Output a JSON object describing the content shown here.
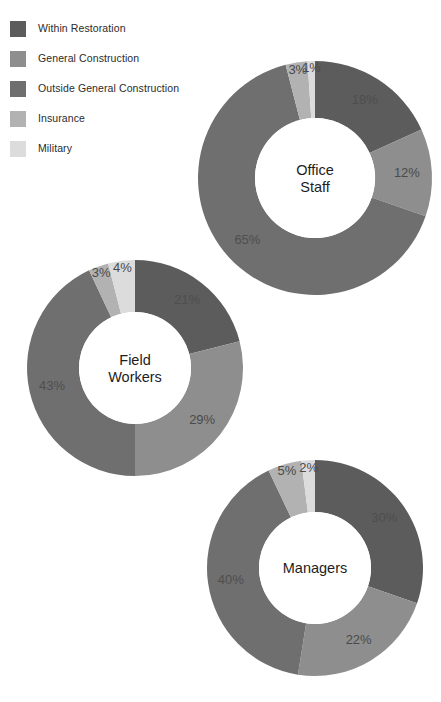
{
  "legend": {
    "items": [
      {
        "label": "Within Restoration",
        "color": "#5c5c5c",
        "key": "within_restoration"
      },
      {
        "label": "General Construction",
        "color": "#8e8e8e",
        "key": "general_construction"
      },
      {
        "label": "Outside General Construction",
        "color": "#6f6f6f",
        "key": "outside_general_construction"
      },
      {
        "label": "Insurance",
        "color": "#b2b2b2",
        "key": "insurance"
      },
      {
        "label": "Military",
        "color": "#dcdcdc",
        "key": "military"
      }
    ]
  },
  "chart_data": {
    "type": "pie",
    "title": "",
    "subtype": "donut",
    "legend_position": "top-left",
    "grid": false,
    "value_suffix": "%",
    "start_angle_deg": 0,
    "direction": "clockwise",
    "categories": [
      "Within Restoration",
      "General Construction",
      "Outside General Construction",
      "Insurance",
      "Military"
    ],
    "colors": [
      "#5c5c5c",
      "#8e8e8e",
      "#6f6f6f",
      "#b2b2b2",
      "#dcdcdc"
    ],
    "series": [
      {
        "name": "Office Staff",
        "center_label_lines": [
          "Office",
          "Staff"
        ],
        "values": [
          18,
          12,
          65,
          3,
          1
        ],
        "labels": [
          "18%",
          "12%",
          "65%",
          "3%",
          "1%"
        ]
      },
      {
        "name": "Field Workers",
        "center_label_lines": [
          "Field",
          "Workers"
        ],
        "values": [
          21,
          29,
          43,
          3,
          4
        ],
        "labels": [
          "21%",
          "29%",
          "43%",
          "3%",
          "4%"
        ]
      },
      {
        "name": "Managers",
        "center_label_lines": [
          "Managers"
        ],
        "values": [
          30,
          22,
          40,
          5,
          2
        ],
        "labels": [
          "30%",
          "22%",
          "40%",
          "5%",
          "2%"
        ]
      }
    ]
  },
  "layout": {
    "donuts": [
      {
        "key": "office-staff",
        "cx": 315,
        "cy": 178,
        "r_outer": 117,
        "r_inner": 60,
        "label_radius": 92,
        "title_font": 15,
        "title_line_height": 17
      },
      {
        "key": "field-workers",
        "cx": 135,
        "cy": 368,
        "r_outer": 108,
        "r_inner": 56,
        "label_radius": 85,
        "title_font": 15,
        "title_line_height": 17
      },
      {
        "key": "managers",
        "cx": 315,
        "cy": 568,
        "r_outer": 108,
        "r_inner": 56,
        "label_radius": 85,
        "title_font": 15,
        "title_line_height": 17
      }
    ]
  }
}
